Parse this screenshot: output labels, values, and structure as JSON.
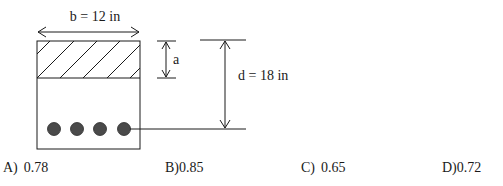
{
  "diagram": {
    "width_label": "b = 12 in",
    "depth_label": "d = 18 in",
    "stress_block_label": "a",
    "bar_count": 4,
    "colors": {
      "line": "#1a1a1a",
      "bar_fill": "#4a4a4a",
      "background": "#ffffff"
    }
  },
  "answers": [
    {
      "letter": "A)",
      "value": "0.78"
    },
    {
      "letter": "B)",
      "value": "0.85"
    },
    {
      "letter": "C)",
      "value": "0.65"
    },
    {
      "letter": "D)",
      "value": "0.72"
    }
  ]
}
